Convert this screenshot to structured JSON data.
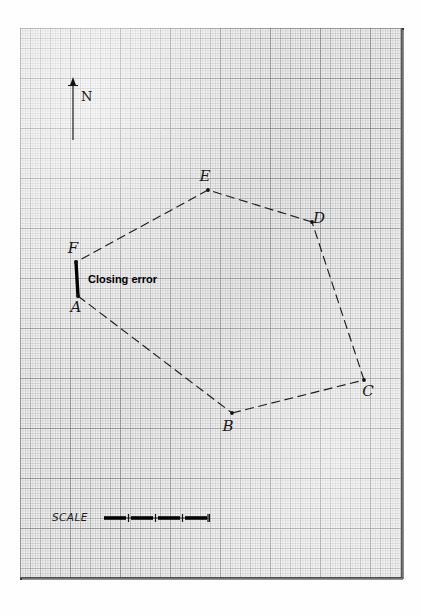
{
  "figure": {
    "kind": "survey-traverse-plot",
    "medium": "graph-paper",
    "closing_error_label": "Closing error",
    "north_label": "N",
    "scale_label": "SCALE"
  },
  "stations": [
    {
      "id": "A",
      "label": "A",
      "x": 78,
      "y": 296,
      "label_dx": -2,
      "label_dy": 16
    },
    {
      "id": "B",
      "label": "B",
      "x": 232,
      "y": 413,
      "label_dx": -4,
      "label_dy": 18
    },
    {
      "id": "C",
      "label": "C",
      "x": 364,
      "y": 380,
      "label_dx": 4,
      "label_dy": 16
    },
    {
      "id": "D",
      "label": "D",
      "x": 312,
      "y": 222,
      "label_dx": 7,
      "label_dy": 1
    },
    {
      "id": "E",
      "label": "E",
      "x": 208,
      "y": 190,
      "label_dx": -3,
      "label_dy": -9
    },
    {
      "id": "F",
      "label": "F",
      "x": 76,
      "y": 262,
      "label_dx": -3,
      "label_dy": -9
    }
  ],
  "traverse_legs": [
    {
      "from": "A",
      "to": "B",
      "style": "dashed"
    },
    {
      "from": "B",
      "to": "C",
      "style": "dashed"
    },
    {
      "from": "C",
      "to": "D",
      "style": "dashed"
    },
    {
      "from": "D",
      "to": "E",
      "style": "dashed"
    },
    {
      "from": "E",
      "to": "F",
      "style": "dashed"
    }
  ],
  "closing_error": {
    "from": "A",
    "to": "F",
    "style": "solid-thick",
    "label": "Closing error",
    "label_x": 88,
    "label_y": 283
  },
  "north_arrow": {
    "label": "N",
    "tip_x": 73,
    "tip_y": 82,
    "tail_x": 73,
    "tail_y": 140,
    "label_x": 81,
    "label_y": 101
  },
  "scale_bar": {
    "label": "SCALE",
    "label_x": 52,
    "label_y": 521,
    "bar_x": 104,
    "bar_y": 518,
    "bar_length": 104,
    "segments": 4,
    "segment_length": 22,
    "segment_gap": 5
  },
  "colors": {
    "paper": "#f2f2f0",
    "grid": "#8a8c94",
    "ink": "#1a1a1a",
    "closing_error_ink": "#000000",
    "sheet_edge": "#3a3a3a"
  }
}
